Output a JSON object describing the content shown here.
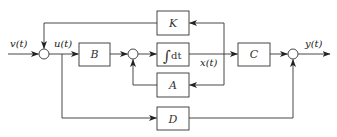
{
  "diagram": {
    "type": "state-space block diagram",
    "signals": {
      "input": "v(t)",
      "control": "u(t)",
      "state": "x(t)",
      "output": "y(t)"
    },
    "blocks": {
      "B": "B",
      "integrator_symbol": "∫",
      "integrator_text": "dt",
      "K": "K",
      "A": "A",
      "C": "C",
      "D": "D"
    },
    "connections": [
      {
        "from": "v(t)",
        "to": "sum1"
      },
      {
        "from": "sum1",
        "to": "B",
        "label": "u(t)"
      },
      {
        "from": "u(t)",
        "to": "D"
      },
      {
        "from": "B",
        "to": "sum2"
      },
      {
        "from": "sum2",
        "to": "integrator"
      },
      {
        "from": "integrator",
        "to": "C",
        "label": "x(t)"
      },
      {
        "from": "x(t)",
        "to": "K"
      },
      {
        "from": "x(t)",
        "to": "A"
      },
      {
        "from": "K",
        "to": "sum1"
      },
      {
        "from": "A",
        "to": "sum2"
      },
      {
        "from": "C",
        "to": "sum3"
      },
      {
        "from": "D",
        "to": "sum3"
      },
      {
        "from": "sum3",
        "to": "y(t)"
      }
    ]
  }
}
